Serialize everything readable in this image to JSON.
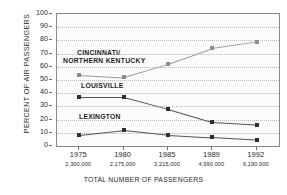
{
  "chart_data": {
    "type": "line",
    "title": "",
    "xlabel": "TOTAL NUMBER OF PASSENGERS",
    "ylabel": "PERCENT OF AIR PASSENGERS",
    "categories": [
      "1975",
      "1980",
      "1985",
      "1989",
      "1992"
    ],
    "category_sublabels": [
      "2,300,000",
      "2,175,000",
      "3,215,000",
      "4,990,000",
      "6,190,000"
    ],
    "ylim": [
      0,
      100
    ],
    "yticks": [
      0,
      10,
      20,
      30,
      40,
      50,
      60,
      70,
      80,
      90,
      100
    ],
    "grid": true,
    "legend": "inline-annotations",
    "series": [
      {
        "name": "CINCINNATI/\nNORTHERN KENTUCKY",
        "label_line1": "CINCINNATI/",
        "label_line2": "NORTHERN KENTUCKY",
        "color": "#8c8c8c",
        "values": [
          54,
          52,
          62,
          74,
          79
        ]
      },
      {
        "name": "LOUISVILLE",
        "label_line1": "LOUISVILLE",
        "label_line2": "",
        "color": "#2f2f2f",
        "values": [
          37,
          37,
          28,
          18,
          16
        ]
      },
      {
        "name": "LEXINGTON",
        "label_line1": "LEXINGTON",
        "label_line2": "",
        "color": "#2f2f2f",
        "values": [
          8.5,
          12,
          8.5,
          6.5,
          4.5
        ]
      }
    ]
  },
  "axes": {
    "y_title": "PERCENT OF AIR PASSENGERS",
    "x_title": "TOTAL NUMBER OF PASSENGERS",
    "ytick_labels": [
      "100",
      "90",
      "80",
      "70",
      "60",
      "50",
      "40",
      "30",
      "20",
      "10",
      "0"
    ]
  },
  "annotations": {
    "cincinnati_line1": "CINCINNATI/",
    "cincinnati_line2": "NORTHERN KENTUCKY",
    "louisville": "LOUISVILLE",
    "lexington": "LEXINGTON"
  },
  "colors": {
    "plot_background": "#fbfbfb",
    "plot_border": "#8a8a8a",
    "gridline": "#b9b9b9",
    "series_dark": "#2f2f2f",
    "series_light": "#8c8c8c",
    "text": "#2b2b2b"
  }
}
